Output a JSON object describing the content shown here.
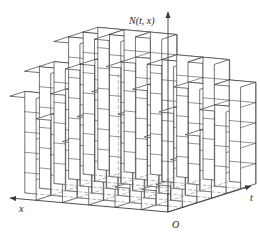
{
  "figure": {
    "type": "3d-isometric-step-surface",
    "background_color": "#ffffff",
    "line_color": "#3a3a3a",
    "hidden_line_color": "#8c8c8c",
    "face_fill": "#ffffff"
  },
  "axes": {
    "vertical": {
      "label": "N(t, x)",
      "label_parts": {
        "name": "N",
        "open": "(",
        "var1": "t",
        "sep": ", ",
        "var2": "x",
        "close": ")"
      },
      "arrow": "up",
      "icon": "axis-arrow-up-icon"
    },
    "right": {
      "label": "t",
      "arrow": "right",
      "icon": "axis-arrow-right-icon"
    },
    "left": {
      "label": "x",
      "arrow": "left",
      "icon": "axis-arrow-left-icon"
    },
    "origin": {
      "label": "O"
    }
  },
  "chart_data": {
    "type": "bar",
    "title": "N(t, x)",
    "xlabel": "t",
    "ylabel": "x",
    "zlabel": "N(t, x)",
    "grid": true,
    "legend": null,
    "note": "Heights are block counts (unit cubes stacked) on a 6 x 6 grid of (t, x) cells; value increases toward the back-right corner forming a staircase.",
    "t_categories": [
      "1",
      "2",
      "3",
      "4",
      "5",
      "6"
    ],
    "x_categories": [
      "1",
      "2",
      "3",
      "4",
      "5",
      "6"
    ],
    "zlim": [
      0,
      7
    ],
    "series": [
      {
        "name": "x=1",
        "values": [
          1,
          1,
          2,
          3,
          4,
          5
        ]
      },
      {
        "name": "x=2",
        "values": [
          1,
          2,
          3,
          4,
          5,
          6
        ]
      },
      {
        "name": "x=3",
        "values": [
          2,
          3,
          4,
          5,
          6,
          6
        ]
      },
      {
        "name": "x=4",
        "values": [
          3,
          4,
          5,
          6,
          6,
          7
        ]
      },
      {
        "name": "x=5",
        "values": [
          4,
          5,
          6,
          6,
          7,
          7
        ]
      },
      {
        "name": "x=6",
        "values": [
          5,
          6,
          6,
          7,
          7,
          7
        ]
      }
    ]
  }
}
